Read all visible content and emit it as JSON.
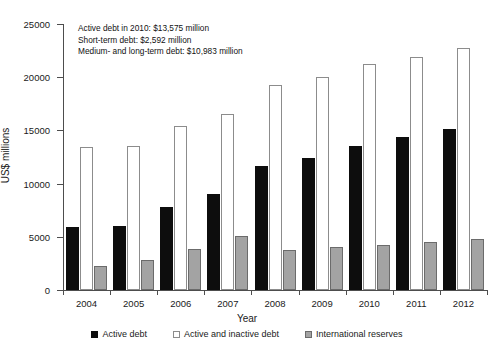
{
  "chart_data": {
    "type": "bar",
    "title": "",
    "xlabel": "Year",
    "ylabel": "US$ millions",
    "ylim": [
      0,
      25000
    ],
    "ytick_step": 5000,
    "yticks": [
      "0",
      "5000",
      "10000",
      "15000",
      "20000",
      "25000"
    ],
    "grid": false,
    "legend_position": "bottom",
    "categories": [
      "2004",
      "2005",
      "2006",
      "2007",
      "2008",
      "2009",
      "2010",
      "2011",
      "2012"
    ],
    "series": [
      {
        "name": "Active debt",
        "color": "#0d0d0d",
        "values": [
          5900,
          6000,
          7800,
          9000,
          11700,
          12400,
          13575,
          14400,
          15100
        ]
      },
      {
        "name": "Active and inactive debt",
        "color": "#ffffff",
        "values": [
          13400,
          13500,
          15400,
          16500,
          19300,
          20000,
          21200,
          21900,
          22700
        ]
      },
      {
        "name": "International reserves",
        "color": "#a3a3a3",
        "values": [
          2250,
          2800,
          3850,
          5100,
          3800,
          4000,
          4200,
          4500,
          4800
        ]
      }
    ],
    "annotations": [
      "Active debt in 2010: $13,575 million",
      "Short-term debt: $2,592 million",
      "Medium- and long-term debt: $10,983 million"
    ]
  }
}
